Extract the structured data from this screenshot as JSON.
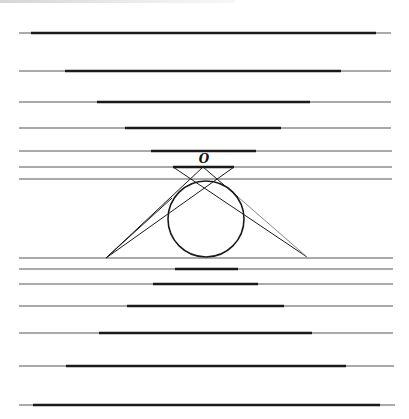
{
  "diagram": {
    "colors": {
      "thick": "#1a1a1a",
      "thin": "#555555",
      "faint": "#888888"
    },
    "label_O": "O",
    "lines": [
      {
        "y": 33,
        "x1": 19,
        "x2": 391,
        "thick": [
          31,
          376
        ]
      },
      {
        "y": 71,
        "x1": 19,
        "x2": 391,
        "thick": [
          65,
          341
        ]
      },
      {
        "y": 102,
        "x1": 19,
        "x2": 391,
        "thick": [
          97,
          310
        ]
      },
      {
        "y": 128,
        "x1": 19,
        "x2": 391,
        "thick": [
          125,
          281
        ]
      },
      {
        "y": 151,
        "x1": 19,
        "x2": 392,
        "thick": [
          151,
          256
        ]
      },
      {
        "y": 167,
        "x1": 19,
        "x2": 392,
        "thick": [
          173,
          234
        ]
      },
      {
        "y": 179,
        "x1": 19,
        "x2": 392,
        "thick": null
      },
      {
        "y": 258,
        "x1": 19,
        "x2": 393,
        "thick": null
      },
      {
        "y": 269,
        "x1": 19,
        "x2": 393,
        "thick": [
          175,
          238
        ]
      },
      {
        "y": 284,
        "x1": 19,
        "x2": 393,
        "thick": [
          153,
          258
        ]
      },
      {
        "y": 306,
        "x1": 19,
        "x2": 393,
        "thick": [
          127,
          284
        ]
      },
      {
        "y": 333,
        "x1": 19,
        "x2": 393,
        "thick": [
          99,
          312
        ]
      },
      {
        "y": 366,
        "x1": 19,
        "x2": 394,
        "thick": [
          66,
          346
        ]
      },
      {
        "y": 405,
        "x1": 19,
        "x2": 395,
        "thick": [
          33,
          380
        ]
      }
    ],
    "circle": {
      "cx": 206,
      "cy": 219,
      "r": 38
    },
    "point_O": {
      "x": 203,
      "y": 167
    },
    "bottom_left": {
      "x": 106,
      "y": 258
    },
    "bottom_right": {
      "x": 307,
      "y": 257
    }
  }
}
